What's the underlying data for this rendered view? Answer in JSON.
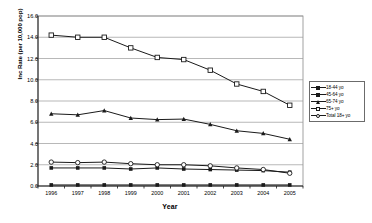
{
  "chart_data": {
    "type": "line",
    "title": "",
    "xlabel": "Year",
    "ylabel": "Inc Rate (per 10,000 pop)",
    "x": [
      1996,
      1997,
      1998,
      1999,
      2000,
      2001,
      2002,
      2003,
      2004,
      2005
    ],
    "xtick_labels": [
      "1996",
      "1997",
      "1998",
      "1999",
      "2000",
      "2001",
      "2002",
      "2003",
      "2004",
      "2005"
    ],
    "ytick_labels": [
      "0.0",
      "2.0",
      "4.0",
      "6.0",
      "8.0",
      "10.0",
      "12.0",
      "14.0",
      "16.0"
    ],
    "ytick_values": [
      0.0,
      2.0,
      4.0,
      6.0,
      8.0,
      10.0,
      12.0,
      14.0,
      16.0
    ],
    "ylim": [
      0.0,
      16.0
    ],
    "grid": "horizontal",
    "legend_position": "right",
    "series": [
      {
        "name": "18-44 yo",
        "marker": "filled-square",
        "values": [
          0.1,
          0.1,
          0.1,
          0.1,
          0.1,
          0.1,
          0.1,
          0.1,
          0.1,
          0.1
        ]
      },
      {
        "name": "45-64 yo",
        "marker": "filled-square",
        "values": [
          1.7,
          1.7,
          1.7,
          1.6,
          1.7,
          1.6,
          1.55,
          1.5,
          1.45,
          1.3
        ]
      },
      {
        "name": "65-74 yo",
        "marker": "filled-triangle",
        "values": [
          6.8,
          6.7,
          7.1,
          6.4,
          6.25,
          6.3,
          5.8,
          5.2,
          4.95,
          4.4
        ]
      },
      {
        "name": "75+ yo",
        "marker": "open-square",
        "values": [
          14.2,
          14.0,
          14.0,
          13.0,
          12.1,
          11.9,
          10.9,
          9.6,
          8.9,
          7.6
        ]
      },
      {
        "name": "Total 18+ yo",
        "marker": "open-circle",
        "values": [
          2.25,
          2.2,
          2.25,
          2.1,
          2.0,
          2.0,
          1.9,
          1.7,
          1.55,
          1.2
        ]
      }
    ]
  },
  "legend": {
    "entries": [
      {
        "label": "18-44 yo"
      },
      {
        "label": "45-64 yo"
      },
      {
        "label": "65-74 yo"
      },
      {
        "label": "75+ yo"
      },
      {
        "label": "Total 18+ yo"
      }
    ]
  }
}
